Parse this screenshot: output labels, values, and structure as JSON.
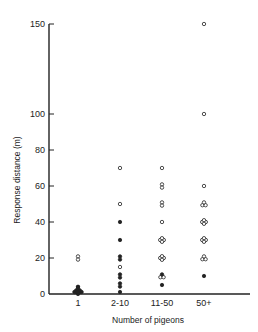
{
  "chart_data": {
    "type": "scatter",
    "title": "",
    "xlabel": "Number of pigeons",
    "ylabel": "Response distance (m)",
    "categories": [
      "1",
      "2-10",
      "11-50",
      "50+"
    ],
    "ylim": [
      0,
      150
    ],
    "yticks": [
      0,
      20,
      40,
      60,
      80,
      100,
      150
    ],
    "grid": false,
    "legend": null,
    "marker_legend": {
      "open_circle": "open symbol",
      "filled_circle": "filled symbol"
    },
    "points": [
      {
        "category": "1",
        "y": 20,
        "marker": "open",
        "count": 2
      },
      {
        "category": "1",
        "y": 4,
        "marker": "filled",
        "count": 1
      },
      {
        "category": "1",
        "y": 3,
        "marker": "filled",
        "count": 2
      },
      {
        "category": "1",
        "y": 2,
        "marker": "filled",
        "count": 3
      },
      {
        "category": "1",
        "y": 1,
        "marker": "filled",
        "count": 4
      },
      {
        "category": "1",
        "y": 0,
        "marker": "filled",
        "count": 5
      },
      {
        "category": "2-10",
        "y": 70,
        "marker": "open",
        "count": 1
      },
      {
        "category": "2-10",
        "y": 50,
        "marker": "open",
        "count": 1
      },
      {
        "category": "2-10",
        "y": 40,
        "marker": "filled",
        "count": 1
      },
      {
        "category": "2-10",
        "y": 30,
        "marker": "filled",
        "count": 1
      },
      {
        "category": "2-10",
        "y": 20,
        "marker": "filled",
        "count": 2
      },
      {
        "category": "2-10",
        "y": 15,
        "marker": "open",
        "count": 1
      },
      {
        "category": "2-10",
        "y": 10,
        "marker": "filled",
        "count": 2
      },
      {
        "category": "2-10",
        "y": 5,
        "marker": "filled",
        "count": 2
      },
      {
        "category": "2-10",
        "y": 0,
        "marker": "filled",
        "count": 1
      },
      {
        "category": "11-50",
        "y": 70,
        "marker": "open",
        "count": 1
      },
      {
        "category": "11-50",
        "y": 60,
        "marker": "open",
        "count": 2
      },
      {
        "category": "11-50",
        "y": 50,
        "marker": "open",
        "count": 2
      },
      {
        "category": "11-50",
        "y": 40,
        "marker": "open",
        "count": 1
      },
      {
        "category": "11-50",
        "y": 30,
        "marker": "mixed",
        "count": 4
      },
      {
        "category": "11-50",
        "y": 20,
        "marker": "mixed",
        "count": 4
      },
      {
        "category": "11-50",
        "y": 10,
        "marker": "mixed",
        "count": 3
      },
      {
        "category": "11-50",
        "y": 5,
        "marker": "filled",
        "count": 1
      },
      {
        "category": "50+",
        "y": 150,
        "marker": "open",
        "count": 1
      },
      {
        "category": "50+",
        "y": 100,
        "marker": "open",
        "count": 1
      },
      {
        "category": "50+",
        "y": 60,
        "marker": "open",
        "count": 1
      },
      {
        "category": "50+",
        "y": 50,
        "marker": "open",
        "count": 3
      },
      {
        "category": "50+",
        "y": 40,
        "marker": "open",
        "count": 4
      },
      {
        "category": "50+",
        "y": 30,
        "marker": "open",
        "count": 4
      },
      {
        "category": "50+",
        "y": 20,
        "marker": "open",
        "count": 3
      },
      {
        "category": "50+",
        "y": 10,
        "marker": "filled",
        "count": 1
      }
    ]
  },
  "axes": {
    "x_title": "Number of pigeons",
    "y_title": "Response distance (m)",
    "x_ticks": [
      {
        "label": "1",
        "x": 78
      },
      {
        "label": "2-10",
        "x": 120
      },
      {
        "label": "11-50",
        "x": 162
      },
      {
        "label": "50+",
        "x": 204
      }
    ],
    "y_ticks": [
      {
        "label": "0",
        "value": 0
      },
      {
        "label": "20",
        "value": 20
      },
      {
        "label": "40",
        "value": 40
      },
      {
        "label": "60",
        "value": 60
      },
      {
        "label": "80",
        "value": 80
      },
      {
        "label": "100",
        "value": 100
      },
      {
        "label": "150",
        "value": 150
      }
    ]
  },
  "colors": {
    "ink": "#222222",
    "background": "#ffffff"
  }
}
